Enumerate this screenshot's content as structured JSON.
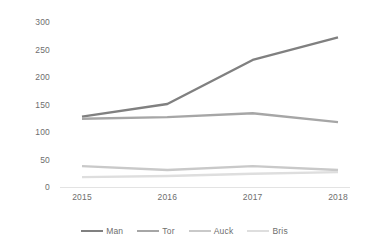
{
  "chart_data": {
    "type": "line",
    "title": "",
    "subtitle": "",
    "xlabel": "",
    "ylabel": "",
    "categories": [
      "2015",
      "2016",
      "2017",
      "2018"
    ],
    "x": [
      2015,
      2016,
      2017,
      2018
    ],
    "ylim": [
      0,
      300
    ],
    "yticks": [
      0,
      50,
      100,
      150,
      200,
      250,
      300
    ],
    "ytick_labels": [
      "0",
      "50",
      "100",
      "150",
      "200",
      "250",
      "300"
    ],
    "grid": false,
    "legend_position": "bottom",
    "series": [
      {
        "name": "Man",
        "values": [
          128,
          151,
          231,
          272
        ],
        "color": "#808080"
      },
      {
        "name": "Tor",
        "values": [
          124,
          127,
          134,
          118
        ],
        "color": "#a6a6a6"
      },
      {
        "name": "Auck",
        "values": [
          38,
          31,
          38,
          31
        ],
        "color": "#c9c9c9"
      },
      {
        "name": "Bris",
        "values": [
          18,
          20,
          24,
          27
        ],
        "color": "#dedede"
      }
    ]
  },
  "colors": {
    "background": "#ffffff",
    "axis_text": "#6e6e6e",
    "axis_line": "#e3e3e3"
  }
}
